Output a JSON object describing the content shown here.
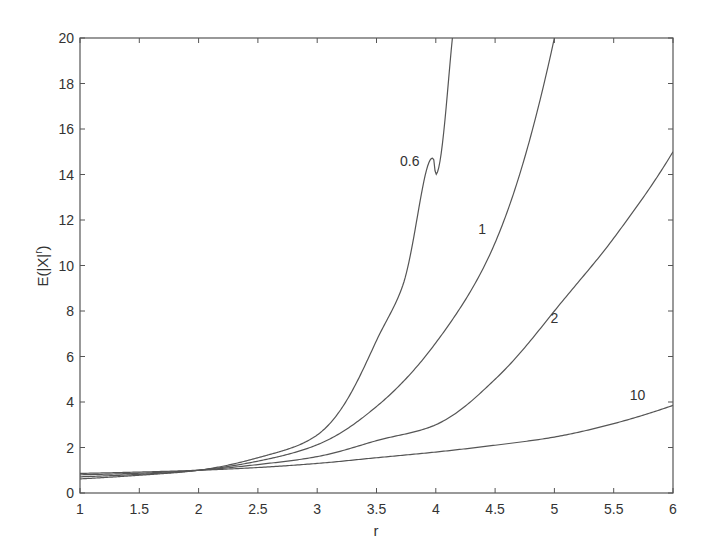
{
  "chart_data": {
    "type": "line",
    "title": "",
    "xlabel": "r",
    "ylabel": "E(|X|^r)",
    "xlim": [
      1,
      6
    ],
    "ylim": [
      0,
      20
    ],
    "grid": false,
    "legend": "none (inline curve labels)",
    "xticks": [
      1,
      1.5,
      2,
      2.5,
      3,
      3.5,
      4,
      4.5,
      5,
      5.5,
      6
    ],
    "xtick_labels": [
      "1",
      "1.5",
      "2",
      "2.5",
      "3",
      "3.5",
      "4",
      "4.5",
      "5",
      "5.5",
      "6"
    ],
    "yticks": [
      0,
      2,
      4,
      6,
      8,
      10,
      12,
      14,
      16,
      18,
      20
    ],
    "ytick_labels": [
      "0",
      "2",
      "4",
      "6",
      "8",
      "10",
      "12",
      "14",
      "16",
      "18",
      "20"
    ],
    "x": [
      1,
      1.5,
      2,
      2.5,
      3,
      3.5,
      4,
      4.5,
      5,
      5.5,
      6
    ],
    "series": [
      {
        "name": "0.6",
        "label": "0.6",
        "label_pos": [
          3.78,
          14.6
        ],
        "values": [
          0.62,
          0.78,
          1.0,
          1.55,
          2.55,
          6.7,
          14.0,
          null,
          null,
          null,
          null
        ],
        "extra_points": [
          [
            3.72,
            9.1
          ],
          [
            3.98,
            14.7
          ],
          [
            4.14,
            20
          ]
        ]
      },
      {
        "name": "1",
        "label": "1",
        "label_pos": [
          4.39,
          11.6
        ],
        "values": [
          0.71,
          0.82,
          1.0,
          1.4,
          2.12,
          3.8,
          6.6,
          11.0,
          20.0,
          null,
          null
        ]
      },
      {
        "name": "2",
        "label": "2",
        "label_pos": [
          5.0,
          7.7
        ],
        "values": [
          0.8,
          0.87,
          1.0,
          1.25,
          1.6,
          2.3,
          3.0,
          5.0,
          8.0,
          11.2,
          15.0
        ]
      },
      {
        "name": "10",
        "label": "10",
        "label_pos": [
          5.7,
          4.3
        ],
        "values": [
          0.86,
          0.92,
          1.0,
          1.12,
          1.3,
          1.55,
          1.8,
          2.1,
          2.46,
          3.05,
          3.85
        ]
      }
    ]
  }
}
